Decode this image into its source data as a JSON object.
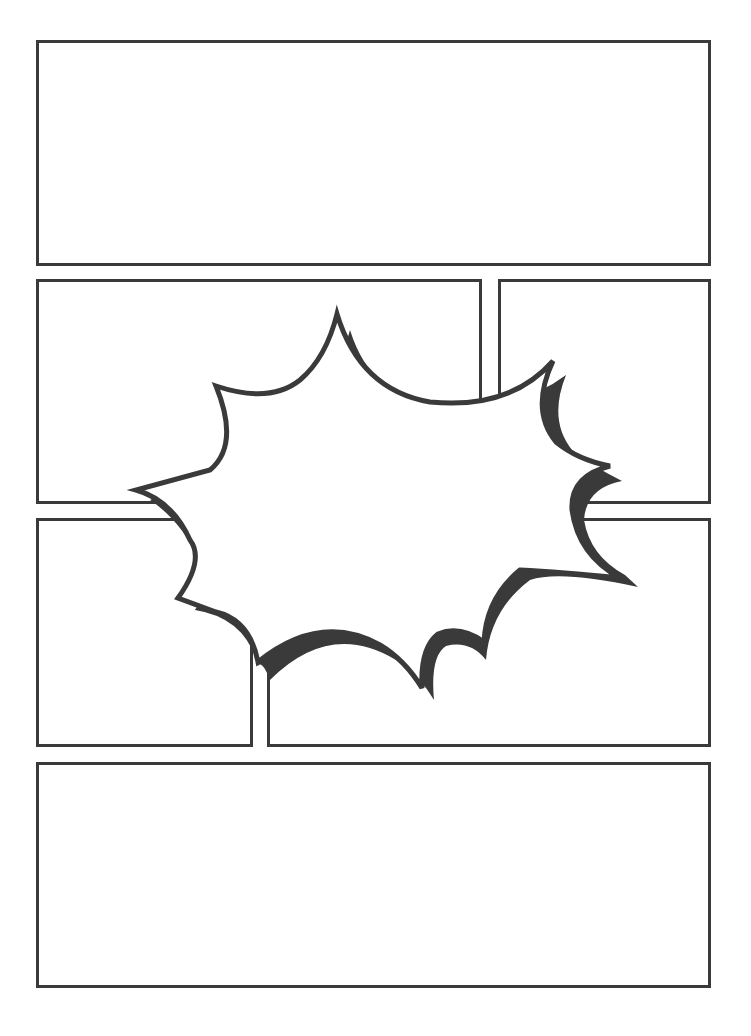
{
  "page": {
    "type": "comic-page-template",
    "background": "#ffffff",
    "border_color": "#3a3a3a"
  },
  "panels": [
    {
      "id": "panel-1",
      "row": 1,
      "x": 36,
      "y": 40,
      "w": 675,
      "h": 226
    },
    {
      "id": "panel-2",
      "row": 2,
      "x": 36,
      "y": 279,
      "w": 446,
      "h": 225
    },
    {
      "id": "panel-3",
      "row": 2,
      "x": 498,
      "y": 279,
      "w": 213,
      "h": 225
    },
    {
      "id": "panel-4",
      "row": 3,
      "x": 36,
      "y": 518,
      "w": 217,
      "h": 229
    },
    {
      "id": "panel-5",
      "row": 3,
      "x": 267,
      "y": 518,
      "w": 444,
      "h": 229
    },
    {
      "id": "panel-6",
      "row": 4,
      "x": 36,
      "y": 762,
      "w": 675,
      "h": 226
    }
  ],
  "burst": {
    "type": "explosion-speech-balloon",
    "fill": "#ffffff",
    "stroke": "#3a3a3a",
    "shadow": "#3a3a3a",
    "text": ""
  }
}
